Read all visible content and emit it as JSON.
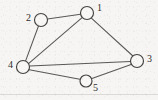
{
  "figure": {
    "kind": "undirected-graph-diagram",
    "background_color": "#f6f5f3",
    "stroke_color": "#43423f",
    "node_fill_color": "#f8f7f5",
    "width": 158,
    "height": 100
  },
  "graph": {
    "node_radius": 6.5,
    "nodes": [
      {
        "id": "1",
        "label": "1",
        "cx": 87,
        "cy": 13,
        "r": 6.5,
        "label_x": 97,
        "label_y": 9
      },
      {
        "id": "2",
        "label": "2",
        "cx": 41,
        "cy": 20,
        "r": 6.5,
        "label_x": 31,
        "label_y": 19
      },
      {
        "id": "3",
        "label": "3",
        "cx": 137,
        "cy": 61,
        "r": 6.5,
        "label_x": 147,
        "label_y": 60
      },
      {
        "id": "4",
        "label": "4",
        "cx": 23,
        "cy": 67,
        "r": 6.5,
        "label_x": 12,
        "label_y": 66
      },
      {
        "id": "5",
        "label": "5",
        "cx": 86,
        "cy": 81,
        "r": 6.0,
        "label_x": 95,
        "label_y": 89
      }
    ],
    "edges": [
      {
        "from": "2",
        "to": "1",
        "x1": 47.4,
        "y1": 18.9,
        "x2": 80.6,
        "y2": 14.3
      },
      {
        "from": "2",
        "to": "4",
        "x1": 38.4,
        "y1": 26.3,
        "x2": 25.7,
        "y2": 60.6
      },
      {
        "from": "4",
        "to": "1",
        "x1": 28.8,
        "y1": 63.4,
        "x2": 82.1,
        "y2": 17.7
      },
      {
        "from": "1",
        "to": "3",
        "x1": 91.4,
        "y1": 18.2,
        "x2": 132.9,
        "y2": 56.0
      },
      {
        "from": "4",
        "to": "3",
        "x1": 29.5,
        "y1": 66.0,
        "x2": 130.5,
        "y2": 61.6
      },
      {
        "from": "4",
        "to": "5",
        "x1": 29.3,
        "y1": 69.7,
        "x2": 79.8,
        "y2": 79.3
      },
      {
        "from": "5",
        "to": "3",
        "x1": 91.9,
        "y1": 78.6,
        "x2": 131.1,
        "y2": 64.6
      }
    ],
    "edge_count": 7,
    "node_count": 5
  },
  "artifacts": {
    "bottom_scan_line": {
      "x1": 0,
      "y1": 94.5,
      "x2": 158,
      "y2": 94.5
    }
  }
}
